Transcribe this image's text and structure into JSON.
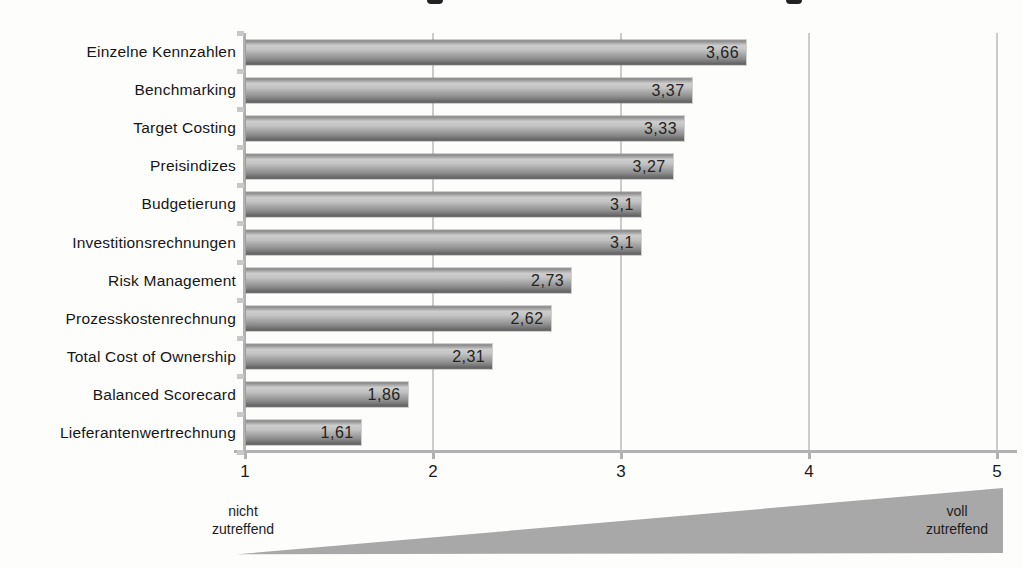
{
  "chart_data": {
    "type": "bar",
    "orientation": "horizontal",
    "title": "",
    "categories": [
      "Einzelne Kennzahlen",
      "Benchmarking",
      "Target Costing",
      "Preisindizes",
      "Budgetierung",
      "Investitionsrechnungen",
      "Risk Management",
      "Prozesskostenrechnung",
      "Total Cost of Ownership",
      "Balanced Scorecard",
      "Lieferantenwertrechnung"
    ],
    "values": [
      3.66,
      3.37,
      3.33,
      3.27,
      3.1,
      3.1,
      2.73,
      2.62,
      2.31,
      1.86,
      1.61
    ],
    "value_labels": [
      "3,66",
      "3,37",
      "3,33",
      "3,27",
      "3,1",
      "3,1",
      "2,73",
      "2,62",
      "2,31",
      "1,86",
      "1,61"
    ],
    "xlim": [
      1,
      5
    ],
    "x_ticks": [
      1,
      2,
      3,
      4,
      5
    ],
    "x_tick_labels": [
      "1",
      "2",
      "3",
      "4",
      "5"
    ],
    "grid": "vertical gridlines at each x tick",
    "legend": "none",
    "scale_annotation": {
      "min_label": "nicht\nzutreffend",
      "max_label": "voll\nzutreffend",
      "shape": "gray wedge triangle growing from left (min) to right (max)"
    }
  },
  "colors": {
    "background": "#fdfdfc",
    "bar_base": "#a0a0a0",
    "bar_highlight": "#cdcdcd",
    "bar_shadow": "#666666",
    "gridline": "#cccccc",
    "axis": "#b2b2b2",
    "wedge": "#a8a8a8",
    "text": "#1c1c1c"
  }
}
